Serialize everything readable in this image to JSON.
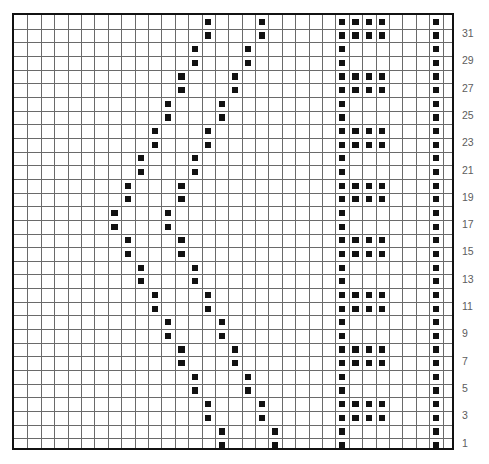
{
  "chart_meta": {
    "kind": "knitting-stitch-chart",
    "columns": 33,
    "rows": 32,
    "cell_px": 13.39,
    "grid_left_px": 12,
    "grid_top_px": 13,
    "mark_color": "#111111",
    "grid_line_color": "#6a6a6a",
    "border_color": "#111111",
    "label_color": "#5d5d5d",
    "background_color": "#ffffff"
  },
  "row_labels": [
    {
      "row": 31,
      "text": "31"
    },
    {
      "row": 29,
      "text": "29"
    },
    {
      "row": 27,
      "text": "27"
    },
    {
      "row": 25,
      "text": "25"
    },
    {
      "row": 23,
      "text": "23"
    },
    {
      "row": 21,
      "text": "21"
    },
    {
      "row": 19,
      "text": "19"
    },
    {
      "row": 17,
      "text": "17"
    },
    {
      "row": 15,
      "text": "15"
    },
    {
      "row": 13,
      "text": "13"
    },
    {
      "row": 11,
      "text": "11"
    },
    {
      "row": 9,
      "text": "9"
    },
    {
      "row": 7,
      "text": "7"
    },
    {
      "row": 5,
      "text": "5"
    },
    {
      "row": 3,
      "text": "3"
    },
    {
      "row": 1,
      "text": "1"
    }
  ],
  "chart_data": {
    "type": "heatmap",
    "title": "",
    "xlabel": "",
    "ylabel": "",
    "grid": true,
    "legend": "none",
    "columns": 33,
    "rows": 32,
    "symbol": "filled-square",
    "row_order": "bottom-to-top",
    "marks_by_row": {
      "32": [
        15,
        19,
        25,
        26,
        27,
        28,
        32
      ],
      "31": [
        15,
        19,
        25,
        26,
        27,
        28,
        32
      ],
      "30": [
        14,
        18,
        25,
        32
      ],
      "29": [
        14,
        18,
        25,
        32
      ],
      "28": [
        13,
        17,
        25,
        26,
        27,
        28,
        32
      ],
      "27": [
        13,
        17,
        25,
        26,
        27,
        28,
        32
      ],
      "26": [
        12,
        16,
        25,
        32
      ],
      "25": [
        12,
        16,
        25,
        32
      ],
      "24": [
        11,
        15,
        25,
        26,
        27,
        28,
        32
      ],
      "23": [
        11,
        15,
        25,
        26,
        27,
        28,
        32
      ],
      "22": [
        10,
        14,
        25,
        32
      ],
      "21": [
        10,
        14,
        25,
        32
      ],
      "20": [
        9,
        13,
        25,
        26,
        27,
        28,
        32
      ],
      "19": [
        9,
        13,
        25,
        26,
        27,
        28,
        32
      ],
      "18": [
        8,
        12,
        25,
        32
      ],
      "17": [
        8,
        12,
        25,
        32
      ],
      "16": [
        9,
        13,
        25,
        26,
        27,
        28,
        32
      ],
      "15": [
        9,
        13,
        25,
        26,
        27,
        28,
        32
      ],
      "14": [
        10,
        14,
        25,
        32
      ],
      "13": [
        10,
        14,
        25,
        32
      ],
      "12": [
        11,
        15,
        25,
        26,
        27,
        28,
        32
      ],
      "11": [
        11,
        15,
        25,
        26,
        27,
        28,
        32
      ],
      "10": [
        12,
        16,
        25,
        32
      ],
      "9": [
        12,
        16,
        25,
        32
      ],
      "8": [
        13,
        17,
        25,
        26,
        27,
        28,
        32
      ],
      "7": [
        13,
        17,
        25,
        26,
        27,
        28,
        32
      ],
      "6": [
        14,
        18,
        25,
        32
      ],
      "5": [
        14,
        18,
        25,
        32
      ],
      "4": [
        15,
        19,
        25,
        26,
        27,
        28,
        32
      ],
      "3": [
        15,
        19,
        25,
        26,
        27,
        28,
        32
      ],
      "2": [
        16,
        20,
        25,
        32
      ],
      "1": [
        16,
        20,
        25,
        32
      ]
    }
  }
}
